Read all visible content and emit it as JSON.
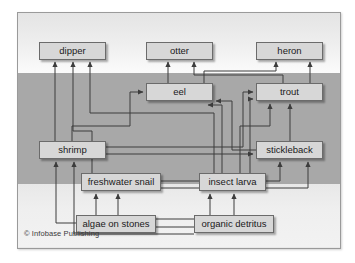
{
  "figure": {
    "credit": "© Infobase Publishing",
    "colors": {
      "node_fill": "#d7d7d7",
      "node_border": "#6b6b6b",
      "band_air": "#efefef",
      "band_water": "#a8a8a8",
      "band_bed": "#eeeeee",
      "arrow": "#3c3c3c",
      "plate_border": "#9a9a9a"
    },
    "bands": [
      {
        "name": "air",
        "label": "",
        "top": 0,
        "height": 60
      },
      {
        "name": "water",
        "label": "",
        "top": 60,
        "height": 111
      },
      {
        "name": "streambed",
        "label": "",
        "top": 171,
        "height": 63
      }
    ]
  },
  "nodes": [
    {
      "id": "dipper",
      "label": "dipper",
      "x": 21,
      "y": 29,
      "w": 67,
      "band": "air"
    },
    {
      "id": "otter",
      "label": "otter",
      "x": 128,
      "y": 29,
      "w": 67,
      "band": "air"
    },
    {
      "id": "heron",
      "label": "heron",
      "x": 238,
      "y": 29,
      "w": 67,
      "band": "air"
    },
    {
      "id": "eel",
      "label": "eel",
      "x": 128,
      "y": 70,
      "w": 67,
      "band": "water"
    },
    {
      "id": "trout",
      "label": "trout",
      "x": 238,
      "y": 70,
      "w": 67,
      "band": "water"
    },
    {
      "id": "shrimp",
      "label": "shrimp",
      "x": 21,
      "y": 128,
      "w": 67,
      "band": "water"
    },
    {
      "id": "stickleback",
      "label": "stickleback",
      "x": 238,
      "y": 128,
      "w": 67,
      "band": "water"
    },
    {
      "id": "freshwater_snail",
      "label": "freshwater snail",
      "x": 63,
      "y": 160,
      "w": 80,
      "band": "water"
    },
    {
      "id": "insect_larva",
      "label": "insect larva",
      "x": 181,
      "y": 160,
      "w": 67,
      "band": "water"
    },
    {
      "id": "algae_on_stones",
      "label": "algae on stones",
      "x": 58,
      "y": 202,
      "w": 80,
      "band": "streambed"
    },
    {
      "id": "organic_detritus",
      "label": "organic detritus",
      "x": 176,
      "y": 202,
      "w": 80,
      "band": "streambed"
    }
  ],
  "links": [
    {
      "from": "shrimp",
      "to": "dipper"
    },
    {
      "from": "freshwater_snail",
      "to": "dipper"
    },
    {
      "from": "insect_larva",
      "to": "dipper"
    },
    {
      "from": "eel",
      "to": "otter"
    },
    {
      "from": "trout",
      "to": "otter"
    },
    {
      "from": "eel",
      "to": "heron"
    },
    {
      "from": "trout",
      "to": "heron"
    },
    {
      "from": "stickleback",
      "to": "heron"
    },
    {
      "from": "shrimp",
      "to": "eel"
    },
    {
      "from": "stickleback",
      "to": "eel"
    },
    {
      "from": "insect_larva",
      "to": "eel"
    },
    {
      "from": "freshwater_snail",
      "to": "trout"
    },
    {
      "from": "insect_larva",
      "to": "trout"
    },
    {
      "from": "shrimp",
      "to": "trout"
    },
    {
      "from": "stickleback",
      "to": "trout"
    },
    {
      "from": "shrimp",
      "to": "stickleback"
    },
    {
      "from": "insect_larva",
      "to": "stickleback"
    },
    {
      "from": "freshwater_snail",
      "to": "stickleback"
    },
    {
      "from": "algae_on_stones",
      "to": "shrimp"
    },
    {
      "from": "organic_detritus",
      "to": "shrimp"
    },
    {
      "from": "algae_on_stones",
      "to": "freshwater_snail"
    },
    {
      "from": "organic_detritus",
      "to": "freshwater_snail"
    },
    {
      "from": "algae_on_stones",
      "to": "insect_larva"
    },
    {
      "from": "organic_detritus",
      "to": "insect_larva"
    }
  ]
}
